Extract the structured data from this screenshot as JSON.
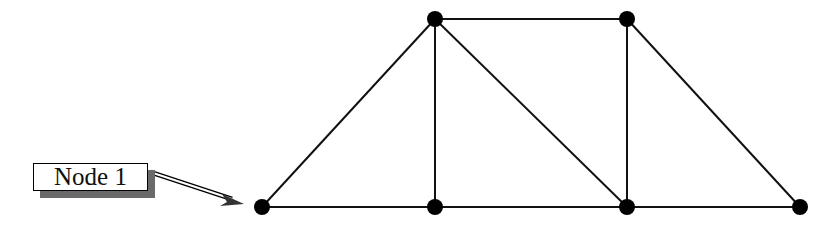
{
  "diagram": {
    "type": "truss",
    "label": "Node 1",
    "colors": {
      "line": "#111111",
      "node": "#000000",
      "shadow": "#6a6a6a"
    },
    "nodes": [
      {
        "id": 1,
        "x": 262,
        "y": 207
      },
      {
        "id": 2,
        "x": 435,
        "y": 207
      },
      {
        "id": 3,
        "x": 627,
        "y": 207
      },
      {
        "id": 4,
        "x": 800,
        "y": 207
      },
      {
        "id": 5,
        "x": 435,
        "y": 19
      },
      {
        "id": 6,
        "x": 627,
        "y": 19
      }
    ],
    "members": [
      [
        1,
        2
      ],
      [
        2,
        3
      ],
      [
        3,
        4
      ],
      [
        5,
        6
      ],
      [
        1,
        5
      ],
      [
        2,
        5
      ],
      [
        5,
        3
      ],
      [
        3,
        6
      ],
      [
        6,
        4
      ]
    ]
  }
}
